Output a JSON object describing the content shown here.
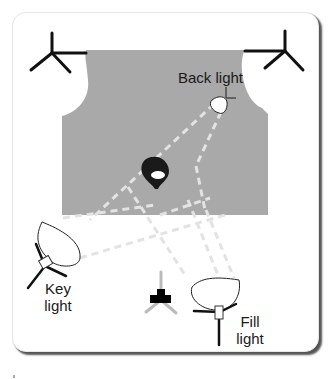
{
  "diagram": {
    "labels": {
      "back_light": "Back light",
      "key_light_1": "Key",
      "key_light_2": "light",
      "fill_light_1": "Fill",
      "fill_light_2": "light"
    },
    "elements": [
      "backdrop",
      "subject",
      "camera",
      "key-light",
      "fill-light",
      "back-light",
      "left-background-stand",
      "right-background-stand"
    ],
    "colors": {
      "backdrop": "#a9a9a9",
      "beam": "#e3e3e3",
      "stand": "#111111",
      "camera": "#000000",
      "camera_tripod": "#bbbbbb"
    }
  }
}
